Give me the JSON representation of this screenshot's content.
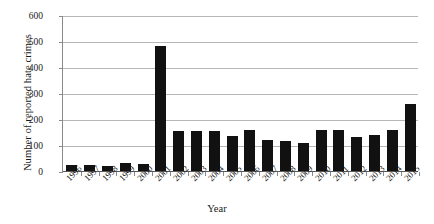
{
  "chart_data": {
    "type": "bar",
    "title": "",
    "xlabel": "Year",
    "ylabel": "Number of reported hate crimes",
    "categories": [
      "1996",
      "1997",
      "1998",
      "1999",
      "2000",
      "2001",
      "2002",
      "2003",
      "2004",
      "2005",
      "2006",
      "2007",
      "2008",
      "2009",
      "2010",
      "2011",
      "2012",
      "2013",
      "2014",
      "2015"
    ],
    "values": [
      27,
      28,
      22,
      34,
      30,
      485,
      158,
      156,
      158,
      140,
      162,
      122,
      118,
      110,
      161,
      160,
      136,
      142,
      160,
      262
    ],
    "ylim": [
      0,
      600
    ],
    "yticks": [
      0,
      100,
      200,
      300,
      400,
      500,
      600
    ],
    "ytick_labels": [
      "0",
      "100",
      "200",
      "300",
      "400",
      "500",
      "600"
    ],
    "grid": true,
    "legend": false,
    "bar_color": "#111111",
    "gridline_color": "#b6b6b6",
    "axis_color": "#8a8a8a"
  }
}
